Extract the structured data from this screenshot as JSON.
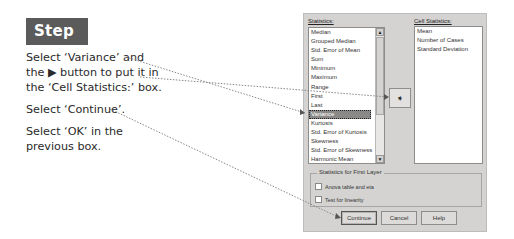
{
  "step": {
    "badge": "Step 4:"
  },
  "instructions": [
    {
      "line1": "Select ‘Variance’ and",
      "line2": "the ▶ button to put it in",
      "line3": "the ‘Cell Statistics:’ box."
    },
    {
      "line1": "Select ‘Continue’."
    },
    {
      "line1": "Select ‘OK’ in the",
      "line2": "previous box."
    }
  ],
  "dialog": {
    "statistics_label": "Statistics:",
    "statistics_items": [
      "Median",
      "Grouped Median",
      "Std. Error of Mean",
      "Sum",
      "Minimum",
      "Maximum",
      "Range",
      "First",
      "Last",
      "Variance",
      "Kurtosis",
      "Std. Error of Kurtosis",
      "Skewness",
      "Std. Error of Skewness",
      "Harmonic Mean"
    ],
    "selected_item": "Variance",
    "move_button_icon": "right-arrow-icon",
    "cell_statistics_label": "Cell Statistics:",
    "cell_statistics_items": [
      "Mean",
      "Number of Cases",
      "Standard Deviation"
    ],
    "first_layer_group": {
      "title": "Statistics for First Layer",
      "options": [
        {
          "label": "Anova table and eta",
          "checked": false
        },
        {
          "label": "Test for linearity",
          "checked": false
        }
      ]
    },
    "buttons": {
      "continue": "Continue",
      "cancel": "Cancel",
      "help": "Help"
    },
    "scroll_up_glyph": "▲",
    "scroll_down_glyph": "▼",
    "move_glyph": "➧"
  },
  "colors": {
    "badge_bg": "#5b5b5b",
    "dialog_bg": "#d4d3d1",
    "selection_bg": "#8a8987"
  }
}
